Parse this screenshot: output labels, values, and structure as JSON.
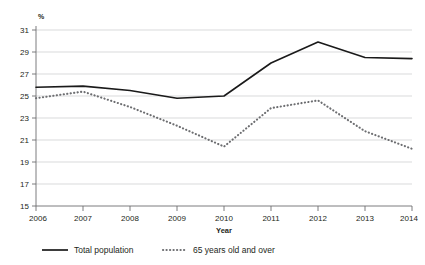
{
  "chart_data": {
    "type": "line",
    "title": "",
    "subtitle": "",
    "xlabel": "Year",
    "ylabel": "",
    "unit_label": "%",
    "x": [
      2006,
      2007,
      2008,
      2009,
      2010,
      2011,
      2012,
      2013,
      2014
    ],
    "categories": [
      "2006",
      "2007",
      "2008",
      "2009",
      "2010",
      "2011",
      "2012",
      "2013",
      "2014"
    ],
    "xlim": [
      2006,
      2014
    ],
    "ylim": [
      15,
      31
    ],
    "ytick_labels": [
      "31",
      "29",
      "27",
      "25",
      "23",
      "21",
      "19",
      "17",
      "15"
    ],
    "ytick_values": [
      31,
      29,
      27,
      25,
      23,
      21,
      19,
      17,
      15
    ],
    "ytick_step": 2,
    "grid": true,
    "grid_axis": "y",
    "legend_position": "bottom-left",
    "series": [
      {
        "name": "Total population",
        "style": "solid",
        "color": "#1a1a1a",
        "values": [
          25.8,
          25.9,
          25.5,
          24.8,
          25.0,
          28.0,
          29.9,
          28.5,
          28.4
        ]
      },
      {
        "name": "65 years old and over",
        "style": "dotted",
        "color": "#6d6e71",
        "values": [
          24.8,
          25.4,
          24.0,
          22.3,
          20.4,
          23.9,
          24.6,
          21.8,
          20.2
        ]
      }
    ],
    "colors": {
      "total_population": "#1a1a1a",
      "seniors": "#6d6e71",
      "gridline": "#c9cacc",
      "axis": "#6d6e71",
      "background": "#ffffff",
      "text": "#231f20"
    }
  },
  "legend": {
    "items": [
      {
        "label": "Total population",
        "style": "solid"
      },
      {
        "label": "65 years old and over",
        "style": "dotted"
      }
    ]
  }
}
